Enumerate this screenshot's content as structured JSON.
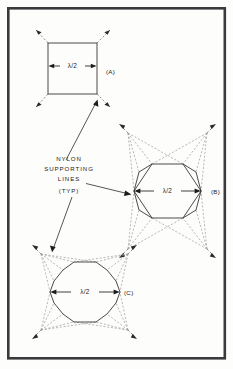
{
  "figure": {
    "background_color": "#fdfdfc",
    "frame_color": "#3a3a3c",
    "line_color": "#2b2b2b",
    "dashed_color": "#9b9b9b"
  },
  "annotation": {
    "line1": "NYLON",
    "line2": "SUPPORTING",
    "line3": "LINES",
    "line4": "(TYP)"
  },
  "shapes": {
    "a": {
      "tag": "(A)",
      "dimension": "λ/2",
      "sides": 4,
      "name": "square-element"
    },
    "b": {
      "tag": "(B)",
      "dimension": "λ/2",
      "sides": 8,
      "name": "octagon-element"
    },
    "c": {
      "tag": "(C)",
      "dimension": "λ/2",
      "sides": 12,
      "name": "dodecagon-element"
    }
  }
}
